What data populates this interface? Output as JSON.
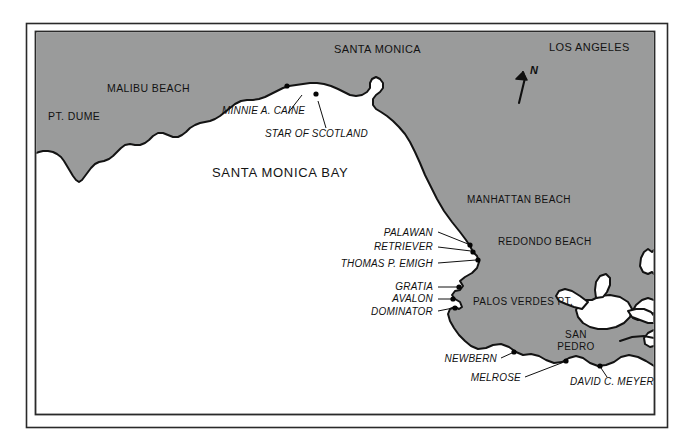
{
  "map": {
    "title": "Santa Monica Bay Shipwreck Map",
    "colors": {
      "land": "#9a9b9b",
      "water": "#ffffff",
      "coastline": "#131313",
      "frame": "#2a2a2a",
      "text": "#111111"
    },
    "frame": {
      "outer": {
        "x": 26,
        "y": 23,
        "width": 642,
        "height": 405
      },
      "inner": {
        "x": 35,
        "y": 31,
        "width": 620,
        "height": 384
      }
    },
    "compass": {
      "label": "N",
      "icon": "north-arrow-icon",
      "x": 516,
      "y": 68
    },
    "place_labels": [
      {
        "name": "pt-dume",
        "text": "PT. DUME",
        "x": 48,
        "y": 120,
        "size": 10.5,
        "anchor": "start"
      },
      {
        "name": "malibu-beach",
        "text": "MALIBU BEACH",
        "x": 107,
        "y": 92,
        "size": 10.5,
        "anchor": "start"
      },
      {
        "name": "santa-monica",
        "text": "SANTA MONICA",
        "x": 334,
        "y": 53,
        "size": 11,
        "anchor": "start"
      },
      {
        "name": "los-angeles",
        "text": "LOS ANGELES",
        "x": 549,
        "y": 51,
        "size": 11,
        "anchor": "start"
      },
      {
        "name": "manhattan-beach",
        "text": "MANHATTAN BEACH",
        "x": 467,
        "y": 203,
        "size": 10,
        "anchor": "start"
      },
      {
        "name": "redondo-beach",
        "text": "REDONDO BEACH",
        "x": 498,
        "y": 245,
        "size": 10,
        "anchor": "start"
      },
      {
        "name": "palos-verdes-pt",
        "text": "PALOS VERDES PT.",
        "x": 473,
        "y": 305,
        "size": 10,
        "anchor": "start"
      }
    ],
    "san_pedro_label": {
      "name": "san-pedro",
      "line1": "SAN",
      "line2": "PEDRO",
      "x": 576,
      "y": 338,
      "size": 10
    },
    "bay_label": {
      "name": "santa-monica-bay",
      "text": "SANTA MONICA BAY",
      "x": 212,
      "y": 177,
      "size": 13
    },
    "wrecks": [
      {
        "name": "minnie-a-caine",
        "text": "MINNIE A. CAINE",
        "label_x": 222,
        "label_y": 114,
        "anchor": "start",
        "size": 10,
        "dot_x": 287,
        "dot_y": 86,
        "leader": "M 288,113 L 302,95"
      },
      {
        "name": "star-of-scotland",
        "text": "STAR OF SCOTLAND",
        "label_x": 265,
        "label_y": 137,
        "anchor": "start",
        "size": 10,
        "dot_x": 316,
        "dot_y": 94,
        "leader": "M 326,128 L 318,101"
      },
      {
        "name": "palawan",
        "text": "PALAWAN",
        "label_x": 433,
        "label_y": 236,
        "anchor": "end",
        "size": 10,
        "dot_x": 470,
        "dot_y": 245,
        "leader": "M 438,232 L 468,244"
      },
      {
        "name": "retriever",
        "text": "RETRIEVER",
        "label_x": 433,
        "label_y": 250,
        "anchor": "end",
        "size": 10,
        "dot_x": 473,
        "dot_y": 252,
        "leader": "M 438,247 L 471,251"
      },
      {
        "name": "thomas-p-emigh",
        "text": "THOMAS P. EMIGH",
        "label_x": 433,
        "label_y": 267,
        "anchor": "end",
        "size": 10,
        "dot_x": 478,
        "dot_y": 260,
        "leader": "M 438,263 L 476,260"
      },
      {
        "name": "gratia",
        "text": "GRATIA",
        "label_x": 433,
        "label_y": 290,
        "anchor": "end",
        "size": 10,
        "dot_x": 459,
        "dot_y": 287,
        "leader": "M 438,287 L 457,287"
      },
      {
        "name": "avalon",
        "text": "AVALON",
        "label_x": 433,
        "label_y": 302,
        "anchor": "end",
        "size": 10,
        "dot_x": 453,
        "dot_y": 299,
        "leader": "M 438,299 L 451,299"
      },
      {
        "name": "dominator",
        "text": "DOMINATOR",
        "label_x": 433,
        "label_y": 315,
        "anchor": "end",
        "size": 10,
        "dot_x": 455,
        "dot_y": 308,
        "leader": "M 438,311 L 453,308"
      },
      {
        "name": "newbern",
        "text": "NEWBERN",
        "label_x": 497,
        "label_y": 362,
        "anchor": "end",
        "size": 10,
        "dot_x": 514,
        "dot_y": 352,
        "leader": "M 501,358 L 512,353"
      },
      {
        "name": "melrose",
        "text": "MELROSE",
        "label_x": 521,
        "label_y": 381,
        "anchor": "end",
        "size": 10,
        "dot_x": 566,
        "dot_y": 361,
        "leader": "M 525,377 L 564,362"
      },
      {
        "name": "david-c-meyer",
        "text": "DAVID C. MEYER",
        "label_x": 570,
        "label_y": 385,
        "anchor": "start",
        "size": 10,
        "dot_x": 600,
        "dot_y": 366,
        "leader": "M 607,377 L 601,368"
      }
    ]
  }
}
